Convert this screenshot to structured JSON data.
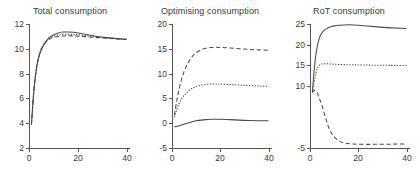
{
  "figure": {
    "width": 418,
    "height": 181,
    "background": "#ffffff",
    "line_color": "#4a4a4a",
    "axis_color": "#555555",
    "text_color": "#3a3a3a"
  },
  "chart_data": [
    {
      "type": "line",
      "title": "Total consumption",
      "xlabel": "",
      "ylabel": "",
      "xlim": [
        0,
        41
      ],
      "ylim": [
        2,
        12
      ],
      "xticks": [
        0,
        20,
        40
      ],
      "xtick_labels": [
        "0",
        "20",
        "40"
      ],
      "yticks": [
        2,
        4,
        6,
        8,
        10,
        12
      ],
      "ytick_labels": [
        "2",
        "4",
        "6",
        "8",
        "10",
        "12"
      ],
      "grid": false,
      "legend": "none",
      "x": [
        1,
        2,
        3,
        4,
        5,
        6,
        7,
        8,
        9,
        10,
        12,
        14,
        16,
        18,
        20,
        24,
        28,
        32,
        36,
        40
      ],
      "series": [
        {
          "name": "solid",
          "style": "solid",
          "values": [
            3.9,
            6.6,
            8.3,
            9.3,
            9.9,
            10.3,
            10.6,
            10.85,
            11.0,
            11.12,
            11.28,
            11.35,
            11.36,
            11.33,
            11.28,
            11.14,
            11.0,
            10.9,
            10.82,
            10.76
          ]
        },
        {
          "name": "dashed",
          "style": "dashed",
          "values": [
            3.9,
            6.65,
            8.35,
            9.35,
            9.95,
            10.3,
            10.55,
            10.72,
            10.84,
            10.92,
            11.0,
            11.04,
            11.05,
            11.04,
            11.02,
            10.96,
            10.9,
            10.85,
            10.8,
            10.76
          ]
        },
        {
          "name": "dotted",
          "style": "dotted",
          "values": [
            3.9,
            6.7,
            8.4,
            9.4,
            10.0,
            10.38,
            10.62,
            10.8,
            10.93,
            11.02,
            11.12,
            11.17,
            11.18,
            11.16,
            11.13,
            11.05,
            10.96,
            10.88,
            10.82,
            10.76
          ]
        }
      ]
    },
    {
      "type": "line",
      "title": "Optimising consumption",
      "xlabel": "",
      "ylabel": "",
      "xlim": [
        0,
        41
      ],
      "ylim": [
        -5,
        20
      ],
      "xticks": [
        0,
        20,
        40
      ],
      "xtick_labels": [
        "0",
        "20",
        "40"
      ],
      "yticks": [
        -5,
        0,
        5,
        10,
        15,
        20
      ],
      "ytick_labels": [
        "-5",
        "0",
        "5",
        "10",
        "15",
        "20"
      ],
      "grid": false,
      "legend": "none",
      "x": [
        1,
        2,
        3,
        4,
        5,
        6,
        7,
        8,
        9,
        10,
        12,
        14,
        16,
        18,
        20,
        24,
        28,
        32,
        36,
        40
      ],
      "series": [
        {
          "name": "dashed",
          "style": "dashed",
          "values": [
            1.6,
            4.6,
            7.0,
            8.9,
            10.4,
            11.6,
            12.5,
            13.2,
            13.8,
            14.2,
            14.8,
            15.1,
            15.25,
            15.3,
            15.28,
            15.15,
            15.0,
            14.88,
            14.78,
            14.7
          ]
        },
        {
          "name": "dotted",
          "style": "dotted",
          "values": [
            1.2,
            2.8,
            4.0,
            4.9,
            5.6,
            6.1,
            6.6,
            6.95,
            7.2,
            7.4,
            7.65,
            7.8,
            7.88,
            7.9,
            7.88,
            7.8,
            7.68,
            7.58,
            7.48,
            7.42
          ]
        },
        {
          "name": "solid",
          "style": "solid",
          "values": [
            -0.7,
            -0.65,
            -0.5,
            -0.35,
            -0.2,
            -0.05,
            0.1,
            0.25,
            0.38,
            0.48,
            0.62,
            0.72,
            0.78,
            0.8,
            0.8,
            0.72,
            0.62,
            0.55,
            0.5,
            0.48
          ]
        }
      ]
    },
    {
      "type": "line",
      "title": "RoT consumption",
      "xlabel": "",
      "ylabel": "",
      "xlim": [
        0,
        41
      ],
      "ylim": [
        -5,
        25
      ],
      "xticks": [
        0,
        20,
        40
      ],
      "xtick_labels": [
        "0",
        "20",
        "40"
      ],
      "yticks": [
        -5,
        10,
        15,
        20,
        25
      ],
      "ytick_labels": [
        "-5",
        "10",
        "15",
        "20",
        "25"
      ],
      "grid": false,
      "legend": "none",
      "x": [
        1,
        2,
        3,
        4,
        5,
        6,
        7,
        8,
        9,
        10,
        12,
        14,
        16,
        18,
        20,
        24,
        28,
        32,
        36,
        40
      ],
      "series": [
        {
          "name": "solid",
          "style": "solid",
          "values": [
            8.6,
            15.5,
            19.6,
            21.8,
            22.9,
            23.5,
            23.9,
            24.2,
            24.4,
            24.55,
            24.7,
            24.78,
            24.8,
            24.78,
            24.72,
            24.5,
            24.3,
            24.12,
            24.0,
            23.9
          ]
        },
        {
          "name": "dotted",
          "style": "dotted",
          "values": [
            8.4,
            12.0,
            14.2,
            15.1,
            15.35,
            15.4,
            15.38,
            15.35,
            15.3,
            15.28,
            15.22,
            15.18,
            15.14,
            15.12,
            15.1,
            15.06,
            15.02,
            15.0,
            14.98,
            14.96
          ]
        },
        {
          "name": "dashed",
          "style": "dashed",
          "values": [
            8.4,
            9.0,
            8.3,
            6.8,
            5.2,
            3.2,
            1.2,
            -0.4,
            -1.5,
            -2.3,
            -3.3,
            -3.75,
            -3.95,
            -4.05,
            -4.1,
            -4.12,
            -4.1,
            -4.08,
            -4.05,
            -4.0
          ]
        }
      ]
    }
  ]
}
